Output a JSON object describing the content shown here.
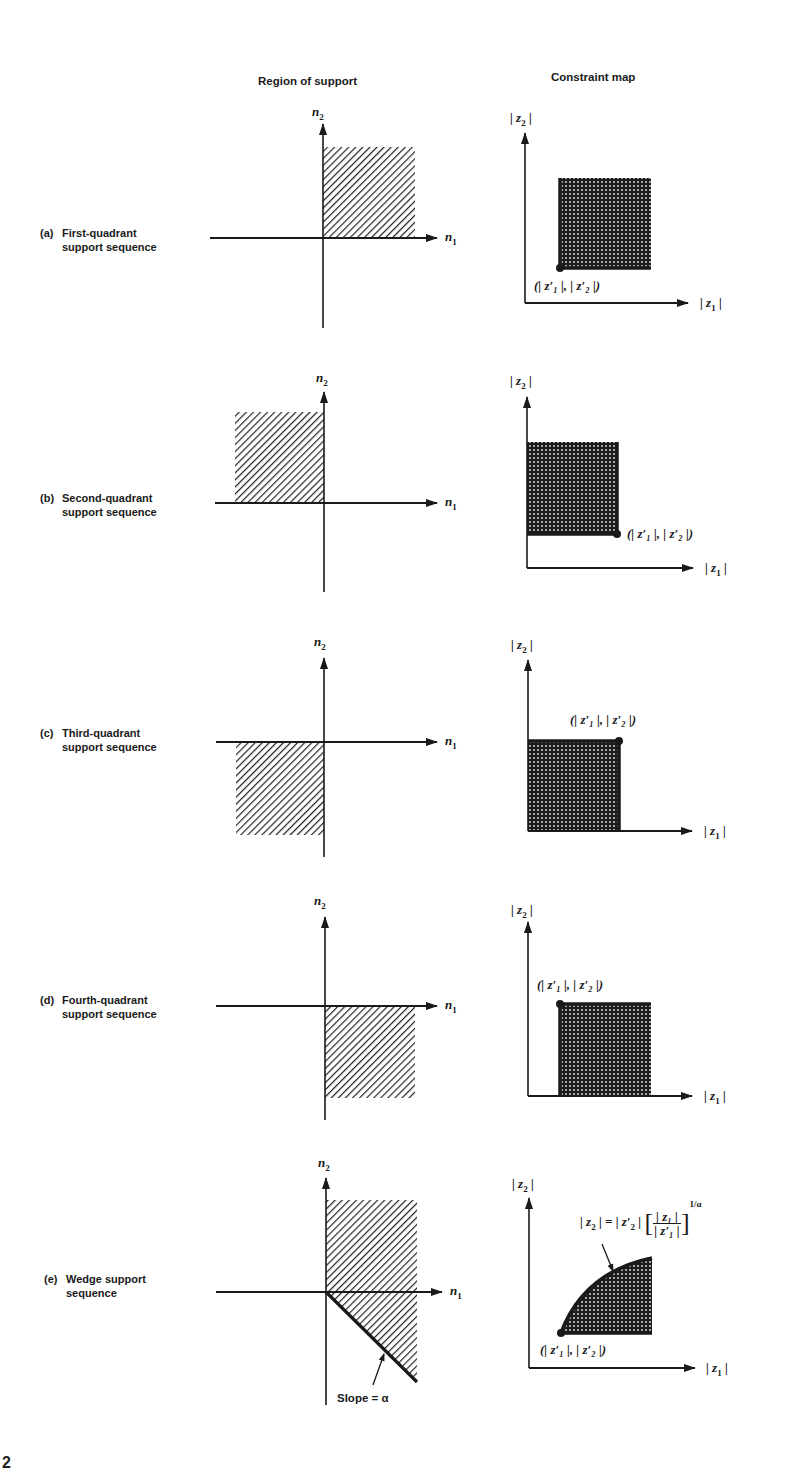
{
  "headers": {
    "region": "Region of support",
    "constraint": "Constraint map"
  },
  "axes": {
    "n1": "n",
    "n1_sub": "1",
    "n2": "n",
    "n2_sub": "2",
    "z1": "| z",
    "z1_sub": "1",
    "z1_close": " |",
    "z2": "| z",
    "z2_sub": "2",
    "z2_close": " |"
  },
  "point_label": "(| z′₁ |, | z′₂ |)",
  "rows": [
    {
      "tag": "(a)",
      "line1": "First-quadrant",
      "line2": "support sequence",
      "region": "first-quadrant",
      "dot_corner": "bottom-left"
    },
    {
      "tag": "(b)",
      "line1": "Second-quadrant",
      "line2": "support sequence",
      "region": "second-quadrant",
      "dot_corner": "bottom-right"
    },
    {
      "tag": "(c)",
      "line1": "Third-quadrant",
      "line2": "support sequence",
      "region": "third-quadrant",
      "dot_corner": "top-right"
    },
    {
      "tag": "(d)",
      "line1": "Fourth-quadrant",
      "line2": "support sequence",
      "region": "fourth-quadrant",
      "dot_corner": "top-left"
    },
    {
      "tag": "(e)",
      "line1": "Wedge support",
      "line2": "sequence",
      "region": "wedge",
      "dot_corner": "bottom-left"
    }
  ],
  "wedge": {
    "slope_label": "Slope = α",
    "formula_lhs": "| z",
    "formula_lhs_sub": "2",
    "formula_eq": " | = | z′",
    "formula_eq_sub": "2",
    "formula_eq_close": " |",
    "formula_num": "| z₁ |",
    "formula_den": "| z′₁ |",
    "formula_exp": "1/α"
  },
  "page_number": "2",
  "colors": {
    "ink": "#1a1a1a",
    "hatch": "#222222",
    "fill_dark": "#1c1c1c",
    "background": "#ffffff"
  }
}
